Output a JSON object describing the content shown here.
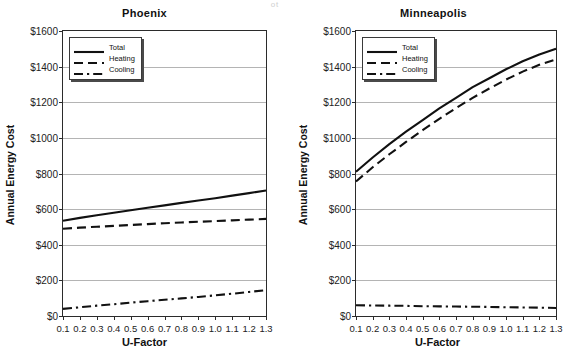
{
  "page": {
    "scan_artifact": "ot"
  },
  "axis": {
    "x_title": "U-Factor",
    "y_title": "Annual Energy Cost",
    "y_ticks": [
      "$0",
      "$200",
      "$400",
      "$600",
      "$800",
      "$1000",
      "$1200",
      "$1400",
      "$1600"
    ],
    "x_ticks": [
      "0.1",
      "0.2",
      "0.3",
      "0.4",
      "0.5",
      "0.6",
      "0.7",
      "0.8",
      "0.9",
      "1.0",
      "1.1",
      "1.2",
      "1.3"
    ]
  },
  "legend": {
    "items": [
      {
        "label": "Total",
        "style": "solid"
      },
      {
        "label": "Heating",
        "style": "dashed"
      },
      {
        "label": "Cooling",
        "style": "dash-dot"
      }
    ]
  },
  "colors": {
    "line": "#111111",
    "grid": "#b4b4b4",
    "frame": "#2b2b2b",
    "background": "#ffffff"
  },
  "chart_data": [
    {
      "type": "line",
      "title": "Phoenix",
      "xlabel": "U-Factor",
      "ylabel": "Annual Energy Cost",
      "xlim": [
        0.1,
        1.3
      ],
      "ylim": [
        0,
        1600
      ],
      "grid": true,
      "legend_position": "top-left",
      "x": [
        0.1,
        0.2,
        0.3,
        0.4,
        0.5,
        0.6,
        0.7,
        0.8,
        0.9,
        1.0,
        1.1,
        1.2,
        1.3
      ],
      "series": [
        {
          "name": "Total",
          "style": "solid",
          "values": [
            535,
            551,
            566,
            580,
            594,
            608,
            621,
            635,
            648,
            661,
            676,
            690,
            705
          ]
        },
        {
          "name": "Heating",
          "style": "dashed",
          "values": [
            490,
            496,
            501,
            506,
            511,
            516,
            521,
            525,
            529,
            533,
            537,
            541,
            545
          ]
        },
        {
          "name": "Cooling",
          "style": "dash-dot",
          "values": [
            40,
            49,
            58,
            66,
            75,
            83,
            91,
            99,
            107,
            116,
            125,
            135,
            145
          ]
        }
      ]
    },
    {
      "type": "line",
      "title": "Minneapolis",
      "xlabel": "U-Factor",
      "ylabel": "Annual Energy Cost",
      "xlim": [
        0.1,
        1.3
      ],
      "ylim": [
        0,
        1600
      ],
      "grid": true,
      "legend_position": "top-left",
      "x": [
        0.1,
        0.2,
        0.3,
        0.4,
        0.5,
        0.6,
        0.7,
        0.8,
        0.9,
        1.0,
        1.1,
        1.2,
        1.3
      ],
      "series": [
        {
          "name": "Total",
          "style": "solid",
          "values": [
            810,
            890,
            965,
            1035,
            1100,
            1165,
            1225,
            1285,
            1335,
            1385,
            1430,
            1468,
            1500
          ]
        },
        {
          "name": "Heating",
          "style": "dashed",
          "values": [
            755,
            835,
            908,
            977,
            1043,
            1107,
            1167,
            1225,
            1277,
            1327,
            1372,
            1410,
            1440
          ]
        },
        {
          "name": "Cooling",
          "style": "dash-dot",
          "values": [
            60,
            59,
            58,
            57,
            55,
            54,
            53,
            52,
            51,
            49,
            48,
            47,
            45
          ]
        }
      ]
    }
  ]
}
